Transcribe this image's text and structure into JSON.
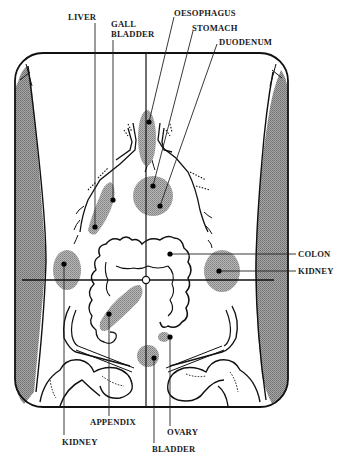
{
  "figure": {
    "type": "anatomical-diagram",
    "colors": {
      "ink": "#111111",
      "organ_shading": "#9a9a9a",
      "flank_shading": "#8c8c8c",
      "background": "#ffffff"
    }
  },
  "labels": {
    "top": [
      {
        "id": "liver",
        "text": "LIVER"
      },
      {
        "id": "gall_bladder_line1",
        "text": "GALL"
      },
      {
        "id": "gall_bladder_line2",
        "text": "BLADDER"
      },
      {
        "id": "oesophagus",
        "text": "OESOPHAGUS"
      },
      {
        "id": "stomach",
        "text": "STOMACH"
      },
      {
        "id": "duodenum",
        "text": "DUODENUM"
      }
    ],
    "right": [
      {
        "id": "colon",
        "text": "COLON"
      },
      {
        "id": "kidney_right",
        "text": "KIDNEY"
      }
    ],
    "bottom": [
      {
        "id": "appendix",
        "text": "APPENDIX"
      },
      {
        "id": "kidney_left",
        "text": "KIDNEY"
      },
      {
        "id": "ovary",
        "text": "OVARY"
      },
      {
        "id": "bladder",
        "text": "BLADDER"
      }
    ]
  },
  "organs": [
    {
      "name": "oesophagus",
      "marker": [
        148,
        122
      ]
    },
    {
      "name": "stomach",
      "marker": [
        153,
        186
      ]
    },
    {
      "name": "duodenum",
      "marker": [
        160,
        206
      ]
    },
    {
      "name": "liver",
      "marker": [
        95,
        227
      ]
    },
    {
      "name": "gall-bladder",
      "marker": [
        113,
        200
      ]
    },
    {
      "name": "colon",
      "marker": [
        170,
        254
      ]
    },
    {
      "name": "kidney-right-side",
      "marker": [
        219,
        271
      ]
    },
    {
      "name": "kidney-left-side",
      "marker": [
        64,
        264
      ]
    },
    {
      "name": "appendix",
      "marker": [
        109,
        314
      ]
    },
    {
      "name": "ovary",
      "marker": [
        170,
        337
      ]
    },
    {
      "name": "bladder",
      "marker": [
        154,
        358
      ]
    }
  ]
}
